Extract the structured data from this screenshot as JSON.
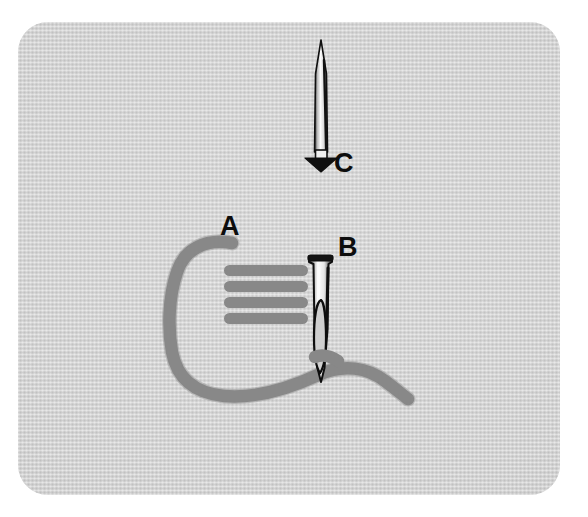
{
  "diagram": {
    "background_color": "#ffffff",
    "panel": {
      "name": "fabric-panel",
      "fill_color": "#d2d2d2",
      "texture": "woven-fabric-weave",
      "corner_radius_px": 30,
      "x": 18,
      "y": 22,
      "width": 542,
      "height": 473
    },
    "labels": [
      {
        "id": "A",
        "text": "A",
        "color": "#0d0d0d",
        "x": 220,
        "y": 213,
        "refers_to": "thread-loop-start-point"
      },
      {
        "id": "B",
        "text": "B",
        "color": "#0d0d0d",
        "x": 338,
        "y": 234,
        "refers_to": "threaded-needle-entry-point"
      },
      {
        "id": "C",
        "text": "C",
        "color": "#0d0d0d",
        "x": 334,
        "y": 150,
        "refers_to": "needle-insertion-direction"
      }
    ],
    "thread": {
      "name": "embroidery-thread",
      "color": "#8a8a8a",
      "stroke_width": 13,
      "shape": "open-loop-curve-from-A-through-needle-eye-to-lower-right"
    },
    "stitches": {
      "name": "satin-stitch-rows",
      "color": "#8a8a8a",
      "count": 4,
      "bar_height": 10,
      "x_start": 224,
      "x_end": 308,
      "y_positions": [
        270,
        286,
        302,
        318
      ]
    },
    "needles": [
      {
        "id": "needle-b",
        "name": "threaded-needle",
        "orientation": "vertical-point-down",
        "has_eye": true,
        "head_style": "flat-rounded-head",
        "x_center": 320,
        "y_top": 255,
        "y_bottom": 382,
        "body_color": "#f2f2f2",
        "outline_color": "#111111"
      },
      {
        "id": "needle-c",
        "name": "insertion-direction-needle",
        "orientation": "vertical-point-up",
        "has_eye": false,
        "head_style": "arrow-base-down",
        "x_center": 321,
        "y_top": 40,
        "y_bottom": 168,
        "body_color": "#f4f4f4",
        "outline_color": "#111111",
        "arrow_direction": "down"
      }
    ]
  }
}
